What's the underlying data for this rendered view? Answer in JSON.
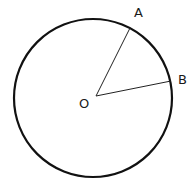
{
  "diagram": {
    "type": "circle-with-radii",
    "circle": {
      "cx": 93,
      "cy": 98,
      "r": 79,
      "stroke": "#111111",
      "stroke_width": 2.2
    },
    "center": {
      "label": "O",
      "x": 96,
      "y": 96,
      "label_x": 79,
      "label_y": 108
    },
    "points": [
      {
        "label": "A",
        "x": 130,
        "y": 28,
        "label_x": 134,
        "label_y": 17
      },
      {
        "label": "B",
        "x": 171,
        "y": 81,
        "label_x": 178,
        "label_y": 84
      }
    ],
    "segments": [
      {
        "from": "O",
        "to": "A"
      },
      {
        "from": "O",
        "to": "B"
      }
    ]
  }
}
